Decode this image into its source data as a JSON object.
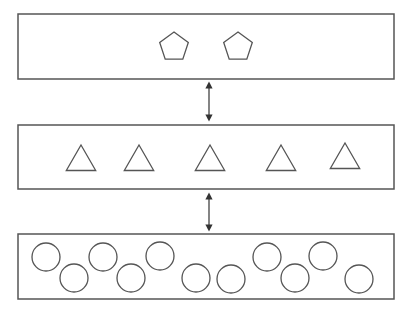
{
  "diagram": {
    "stroke_color": "#555555",
    "background": "#ffffff",
    "layers": [
      {
        "name": "top-layer",
        "box": {
          "x": 18,
          "y": 14,
          "w": 376,
          "h": 65
        },
        "shape": "pentagon",
        "items": [
          {
            "cx": 174,
            "cy": 47
          },
          {
            "cx": 238,
            "cy": 47
          }
        ]
      },
      {
        "name": "middle-layer",
        "box": {
          "x": 18,
          "y": 125,
          "w": 376,
          "h": 64
        },
        "shape": "triangle",
        "items": [
          {
            "cx": 81,
            "cy": 159
          },
          {
            "cx": 139,
            "cy": 159
          },
          {
            "cx": 210,
            "cy": 159
          },
          {
            "cx": 281,
            "cy": 159
          },
          {
            "cx": 345,
            "cy": 157
          }
        ]
      },
      {
        "name": "bottom-layer",
        "box": {
          "x": 18,
          "y": 234,
          "w": 376,
          "h": 65
        },
        "shape": "circle",
        "items": [
          {
            "cx": 46,
            "cy": 257
          },
          {
            "cx": 74,
            "cy": 278
          },
          {
            "cx": 103,
            "cy": 257
          },
          {
            "cx": 131,
            "cy": 278
          },
          {
            "cx": 160,
            "cy": 256
          },
          {
            "cx": 196,
            "cy": 278
          },
          {
            "cx": 231,
            "cy": 279
          },
          {
            "cx": 267,
            "cy": 257
          },
          {
            "cx": 295,
            "cy": 278
          },
          {
            "cx": 323,
            "cy": 256
          },
          {
            "cx": 359,
            "cy": 279
          }
        ]
      }
    ],
    "arrows": [
      {
        "name": "arrow-top-middle",
        "x": 209,
        "y1": 85,
        "y2": 118,
        "bidirectional": true
      },
      {
        "name": "arrow-middle-bottom",
        "x": 209,
        "y1": 196,
        "y2": 228,
        "bidirectional": true
      }
    ]
  }
}
